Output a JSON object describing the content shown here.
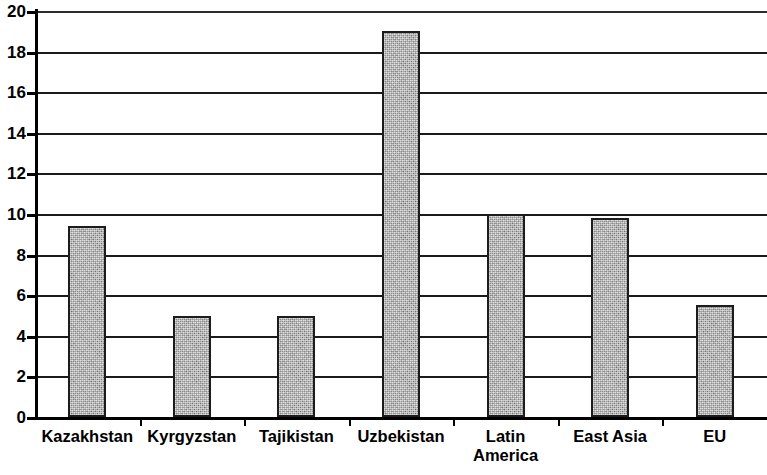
{
  "chart_data": {
    "type": "bar",
    "title": "",
    "subtitle": "",
    "xlabel": "",
    "ylabel": "",
    "categories": [
      "Kazakhstan",
      "Kyrgyzstan",
      "Tajikistan",
      "Uzbekistan",
      "Latin\nAmerica",
      "East Asia",
      "EU"
    ],
    "values": [
      9.4,
      5.0,
      5.0,
      19.0,
      10.0,
      9.8,
      5.5
    ],
    "ylim": [
      0,
      20
    ],
    "ytick_step": 2,
    "ytick_labels": [
      "0",
      "2",
      "4",
      "6",
      "8",
      "10",
      "12",
      "14",
      "16",
      "18",
      "20"
    ],
    "ytick_values": [
      0,
      2,
      4,
      6,
      8,
      10,
      12,
      14,
      16,
      18,
      20
    ],
    "grid": "horizontal",
    "legend": "none",
    "bar_fill_color": "#ababab",
    "bar_edge_color": "#1c1c1c",
    "axis_color": "#000000",
    "gridline_color": "#1a1a1a",
    "background_color": "#ffffff"
  }
}
